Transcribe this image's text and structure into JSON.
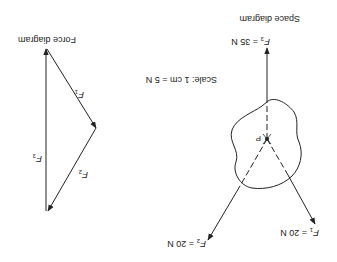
{
  "orientation": "rotated-180",
  "space_diagram": {
    "title": "Space diagram",
    "point_label": "P",
    "forces": [
      {
        "name": "F",
        "sub": "1",
        "value": "= 20 N"
      },
      {
        "name": "F",
        "sub": "2",
        "value": "= 20 N"
      },
      {
        "name": "F",
        "sub": "3",
        "value": "= 35 N"
      }
    ]
  },
  "scale": {
    "label": "Scale: 1 cm = 5 N"
  },
  "force_diagram": {
    "title": "Force diagram",
    "vectors": [
      {
        "name": "F",
        "sub": "1"
      },
      {
        "name": "F",
        "sub": "2"
      },
      {
        "name": "F",
        "sub": "3"
      }
    ]
  },
  "colors": {
    "line": "#222222",
    "background": "#ffffff"
  }
}
